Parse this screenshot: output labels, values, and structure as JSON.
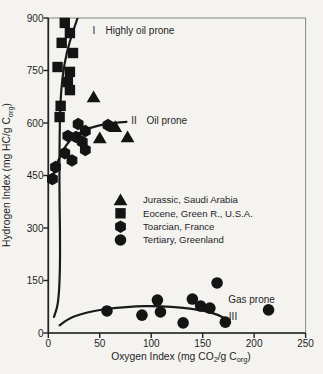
{
  "figure": {
    "background": "#f4f3f0",
    "frame_color": "#8f8f8f",
    "axis_color": "#222222",
    "marker_color": "#141414",
    "curve_color": "#1a1a1a",
    "text_color": "#1e1e1e"
  },
  "layout": {
    "width": 323,
    "height": 374,
    "plot": {
      "left": 48.3,
      "top": 18,
      "right": 305.6,
      "bottom": 333
    },
    "tick_len": 5,
    "fonts": {
      "tick": 10,
      "axis": 10.3,
      "legend": 9.6,
      "annotation": 10
    },
    "x_tick_label_y": 346.5,
    "y_tick_label_x": 43.5,
    "xlabel_pos": {
      "x": 181,
      "y": 359.5
    },
    "ylabel_pos": {
      "x": 10,
      "y": 175
    }
  },
  "chart_data": {
    "type": "scatter",
    "title": "",
    "xlabel_parts": [
      {
        "t": "Oxygen Index (mg CO"
      },
      {
        "t": "2",
        "sub": true
      },
      {
        "t": "/g C"
      },
      {
        "t": "org",
        "sub": true
      },
      {
        "t": ")"
      }
    ],
    "ylabel_parts": [
      {
        "t": "Hydrogen Index (mg HC/g C"
      },
      {
        "t": "org",
        "sub": true
      },
      {
        "t": ")"
      }
    ],
    "xlim": [
      0,
      250
    ],
    "ylim": [
      0,
      900
    ],
    "x_ticks": [
      0,
      50,
      100,
      150,
      200,
      250
    ],
    "y_ticks": [
      0,
      150,
      300,
      450,
      600,
      750,
      900
    ],
    "series": [
      {
        "name": "Jurassic, Saudi Arabia",
        "marker": "triangle",
        "points": [
          [
            44,
            674
          ],
          [
            65,
            589
          ],
          [
            77,
            560
          ],
          [
            50,
            557
          ]
        ]
      },
      {
        "name": "Eocene, Green R., U.S.A.",
        "marker": "square",
        "points": [
          [
            16,
            886
          ],
          [
            21,
            857
          ],
          [
            13,
            829
          ],
          [
            24,
            800
          ],
          [
            9,
            760
          ],
          [
            21,
            746
          ],
          [
            19,
            717
          ],
          [
            21,
            694
          ],
          [
            12,
            649
          ],
          [
            11,
            617
          ]
        ]
      },
      {
        "name": "Toarcian, France",
        "marker": "hexagon",
        "points": [
          [
            29,
            597
          ],
          [
            58,
            594
          ],
          [
            36,
            577
          ],
          [
            19,
            563
          ],
          [
            27,
            560
          ],
          [
            33,
            546
          ],
          [
            36,
            523
          ],
          [
            16,
            514
          ],
          [
            23,
            493
          ],
          [
            7,
            474
          ],
          [
            4,
            440
          ]
        ]
      },
      {
        "name": "Tertiary, Greenland",
        "marker": "circle",
        "points": [
          [
            57,
            63
          ],
          [
            91,
            51
          ],
          [
            106,
            94
          ],
          [
            109,
            60
          ],
          [
            131,
            29
          ],
          [
            140,
            97
          ],
          [
            148,
            77
          ],
          [
            157,
            71
          ],
          [
            164,
            143
          ],
          [
            172,
            31
          ],
          [
            214,
            66
          ]
        ]
      }
    ],
    "curves": [
      {
        "name": "I",
        "points": [
          [
            28.5,
            900
          ],
          [
            24,
            862
          ],
          [
            18,
            805
          ],
          [
            13.5,
            730
          ],
          [
            11.5,
            650
          ],
          [
            11,
            560
          ],
          [
            10.8,
            460
          ],
          [
            11,
            360
          ],
          [
            11.5,
            260
          ],
          [
            11.3,
            160
          ],
          [
            9.5,
            80
          ],
          [
            5.5,
            46
          ]
        ]
      },
      {
        "name": "II",
        "points": [
          [
            3,
            428
          ],
          [
            6,
            468
          ],
          [
            11,
            502
          ],
          [
            17,
            537
          ],
          [
            25,
            562
          ],
          [
            35,
            580
          ],
          [
            47,
            592
          ],
          [
            59,
            599
          ],
          [
            70,
            602
          ],
          [
            76,
            603
          ]
        ]
      },
      {
        "name": "III",
        "points": [
          [
            11,
            22
          ],
          [
            19,
            40
          ],
          [
            31,
            54
          ],
          [
            47,
            65
          ],
          [
            66,
            72
          ],
          [
            86,
            76
          ],
          [
            101,
            77
          ],
          [
            119,
            75
          ],
          [
            138,
            70
          ],
          [
            154,
            62
          ],
          [
            165,
            52
          ],
          [
            173,
            40
          ]
        ]
      }
    ],
    "annotations": [
      {
        "text": "I",
        "x": 94,
        "y": 33.5,
        "anchor": "middle"
      },
      {
        "text": "Highly oil prone",
        "x": 105.5,
        "y": 33.5,
        "anchor": "start"
      },
      {
        "text": "II",
        "x": 134,
        "y": 123.5,
        "anchor": "middle"
      },
      {
        "text": "Oil prone",
        "x": 146.5,
        "y": 123.5,
        "anchor": "start"
      },
      {
        "text": "Gas prone",
        "x": 251.5,
        "y": 302.5,
        "anchor": "middle"
      },
      {
        "text": "III",
        "x": 233,
        "y": 320,
        "anchor": "middle"
      }
    ],
    "legend": {
      "marker_x": 120.5,
      "text_x": 143,
      "row_ys": [
        200,
        213.3,
        226.7,
        240
      ],
      "entries": [
        {
          "marker": "triangle",
          "label": "Jurassic, Saudi Arabia"
        },
        {
          "marker": "square",
          "label": "Eocene, Green R., U.S.A."
        },
        {
          "marker": "hexagon",
          "label": "Toarcian, France"
        },
        {
          "marker": "circle",
          "label": "Tertiary, Greenland"
        }
      ]
    }
  }
}
